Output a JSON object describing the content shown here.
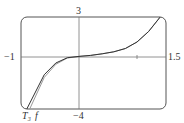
{
  "figure_label": "27.",
  "chart_data": {
    "type": "line",
    "title": "",
    "xlabel": "",
    "ylabel": "",
    "xlim": [
      -1,
      1.5
    ],
    "ylim": [
      -4,
      3
    ],
    "tick_labels": {
      "x_min": "-1",
      "x_max": "1.5",
      "y_max": "3",
      "y_min": "-4"
    },
    "grid": false,
    "series": [
      {
        "name": "f",
        "label": "f",
        "color": "#888888",
        "x": [
          -0.85,
          -0.6,
          -0.4,
          -0.2,
          0,
          0.2,
          0.4,
          0.6,
          0.8,
          1.0,
          1.2,
          1.4
        ],
        "y": [
          -4.0,
          -1.6,
          -0.6,
          -0.12,
          0,
          0.08,
          0.2,
          0.35,
          0.6,
          1.1,
          1.9,
          3.0
        ]
      },
      {
        "name": "T3",
        "label": "T₃",
        "color": "#444444",
        "x": [
          -0.9,
          -0.6,
          -0.4,
          -0.2,
          0,
          0.2,
          0.4,
          0.6,
          0.8,
          1.0,
          1.2,
          1.4
        ],
        "y": [
          -4.0,
          -1.4,
          -0.5,
          -0.1,
          0,
          0.08,
          0.2,
          0.35,
          0.6,
          1.1,
          1.9,
          3.0
        ]
      }
    ]
  },
  "labels": {
    "y_top": "3",
    "y_bottom": "−4",
    "x_left": "−1",
    "x_right": "1.5",
    "t3": "T₃",
    "f": "f"
  }
}
